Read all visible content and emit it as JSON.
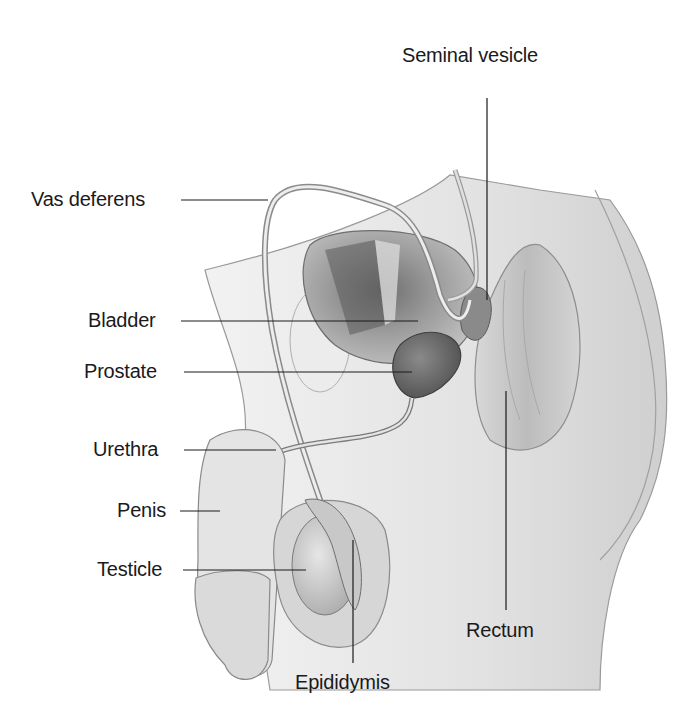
{
  "diagram": {
    "style": "grayscale anatomical illustration",
    "labels": {
      "seminal_vesicle": "Seminal vesicle",
      "vas_deferens": "Vas deferens",
      "bladder": "Bladder",
      "prostate": "Prostate",
      "urethra": "Urethra",
      "penis": "Penis",
      "testicle": "Testicle",
      "epididymis": "Epididymis",
      "rectum": "Rectum"
    }
  }
}
